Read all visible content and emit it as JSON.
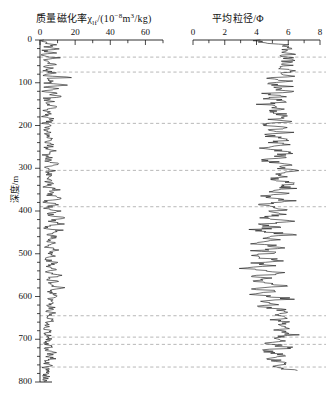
{
  "figure": {
    "y_axis": {
      "label": "深度/m",
      "ticks": [
        0,
        100,
        200,
        300,
        400,
        500,
        600,
        700,
        800
      ],
      "min": 0,
      "max": 800,
      "minor_step": 20
    },
    "dashed_markers": [
      40,
      75,
      195,
      305,
      390,
      645,
      695,
      712,
      765
    ],
    "line_color": "#1a1a1a",
    "dash_color": "#9a9a9a"
  },
  "panels": {
    "left": {
      "title_main": "质量磁化率",
      "title_symbol": "χ",
      "title_sub": "lf",
      "title_units_pre": "/(10",
      "title_units_sup": "−8",
      "title_units_post": "m",
      "title_units_sup2": "3",
      "title_units_end": "/kg)",
      "ticks": [
        0,
        20,
        40,
        60
      ],
      "min": 0,
      "max": 70
    },
    "right": {
      "title": "平均粒径/Φ",
      "ticks": [
        0,
        2,
        4,
        6,
        8
      ],
      "min": 0,
      "max": 8
    }
  },
  "chart_data": {
    "type": "line",
    "orientation": "vertical-depth",
    "ylabel": "深度/m",
    "ylim": [
      0,
      800
    ],
    "y_inverted": true,
    "grid": false,
    "legend": "none",
    "series": [
      {
        "name": "质量磁化率χlf/(10⁻⁸m³/kg)",
        "panel": "left",
        "xlabel": "质量磁化率χlf/(10⁻⁸m³/kg)",
        "xlim": [
          0,
          70
        ],
        "xticks": [
          0,
          20,
          40,
          60
        ],
        "depth": [
          0,
          5,
          9,
          12,
          15,
          18,
          21,
          24,
          27,
          30,
          33,
          36,
          39,
          42,
          45,
          48,
          51,
          54,
          57,
          60,
          63,
          66,
          69,
          72,
          75,
          78,
          81,
          84,
          87,
          90,
          93,
          96,
          99,
          102,
          105,
          108,
          111,
          114,
          117,
          120,
          124,
          128,
          132,
          136,
          140,
          144,
          148,
          152,
          156,
          160,
          165,
          170,
          175,
          180,
          185,
          190,
          195,
          200,
          205,
          210,
          215,
          220,
          225,
          230,
          235,
          240,
          245,
          250,
          255,
          260,
          265,
          270,
          275,
          280,
          285,
          290,
          295,
          300,
          305,
          310,
          315,
          320,
          325,
          330,
          335,
          340,
          345,
          350,
          355,
          360,
          365,
          370,
          375,
          380,
          385,
          390,
          395,
          400,
          405,
          410,
          415,
          420,
          425,
          430,
          435,
          440,
          445,
          450,
          455,
          460,
          465,
          470,
          475,
          480,
          485,
          490,
          495,
          500,
          505,
          510,
          515,
          520,
          525,
          530,
          535,
          540,
          545,
          550,
          555,
          560,
          565,
          570,
          575,
          580,
          585,
          590,
          595,
          600,
          605,
          610,
          615,
          620,
          625,
          630,
          635,
          640,
          645,
          650,
          655,
          660,
          665,
          670,
          675,
          680,
          685,
          690,
          695,
          700,
          705,
          710,
          715,
          720,
          725,
          730,
          735,
          740,
          745,
          750,
          755,
          760,
          765,
          770,
          775,
          780,
          785,
          790,
          795,
          800
        ],
        "values": [
          2,
          4,
          3,
          10,
          4,
          3,
          9,
          3,
          2,
          12,
          3,
          2,
          4,
          14,
          3,
          2,
          5,
          3,
          13,
          4,
          3,
          9,
          4,
          3,
          6,
          8,
          5,
          3,
          21,
          4,
          3,
          7,
          5,
          4,
          16,
          5,
          3,
          12,
          4,
          3,
          9,
          5,
          14,
          4,
          3,
          7,
          5,
          3,
          10,
          4,
          3,
          6,
          4,
          3,
          8,
          5,
          3,
          6,
          4,
          3,
          5,
          4,
          3,
          6,
          4,
          3,
          7,
          5,
          4,
          9,
          5,
          3,
          6,
          5,
          4,
          12,
          6,
          4,
          8,
          5,
          4,
          7,
          5,
          4,
          6,
          5,
          4,
          10,
          6,
          4,
          7,
          15,
          5,
          4,
          9,
          5,
          4,
          12,
          7,
          5,
          16,
          9,
          5,
          13,
          6,
          4,
          11,
          7,
          5,
          9,
          6,
          4,
          8,
          5,
          4,
          10,
          6,
          4,
          7,
          5,
          4,
          9,
          6,
          4,
          8,
          6,
          5,
          11,
          7,
          5,
          9,
          6,
          5,
          13,
          8,
          5,
          10,
          7,
          5,
          9,
          6,
          5,
          8,
          6,
          5,
          7,
          6,
          5,
          6,
          5,
          4,
          5,
          4,
          4,
          5,
          4,
          4,
          5,
          4,
          4,
          6,
          5,
          4,
          8,
          6,
          5,
          7,
          5,
          4,
          5,
          4,
          3,
          4,
          3,
          3,
          4,
          3,
          3,
          3,
          3,
          3
        ]
      },
      {
        "name": "平均粒径/Φ",
        "panel": "right",
        "xlabel": "平均粒径/Φ",
        "xlim": [
          0,
          8
        ],
        "xticks": [
          0,
          2,
          4,
          6,
          8
        ],
        "depth": [
          0,
          6,
          12,
          18,
          24,
          30,
          36,
          42,
          48,
          54,
          60,
          66,
          72,
          78,
          84,
          90,
          96,
          102,
          108,
          114,
          120,
          126,
          132,
          138,
          144,
          150,
          156,
          162,
          168,
          174,
          180,
          186,
          192,
          198,
          204,
          210,
          216,
          222,
          228,
          234,
          240,
          246,
          252,
          258,
          264,
          270,
          276,
          282,
          288,
          294,
          300,
          306,
          312,
          318,
          324,
          330,
          336,
          342,
          348,
          354,
          360,
          366,
          372,
          378,
          384,
          390,
          396,
          402,
          408,
          414,
          420,
          426,
          432,
          438,
          444,
          450,
          456,
          462,
          468,
          474,
          480,
          486,
          492,
          498,
          504,
          510,
          516,
          522,
          528,
          534,
          540,
          546,
          552,
          558,
          564,
          570,
          576,
          582,
          588,
          594,
          600,
          606,
          612,
          618,
          624,
          630,
          636,
          642,
          648,
          654,
          660,
          666,
          672,
          678,
          684,
          690,
          696,
          702,
          708,
          714,
          720,
          726,
          732,
          738,
          744,
          750,
          756,
          762,
          768,
          774,
          780
        ],
        "values": [
          3.9,
          4.8,
          5.6,
          5.7,
          5.8,
          5.9,
          6.0,
          5.8,
          6.1,
          5.9,
          6.2,
          5.4,
          6.3,
          5.6,
          6.1,
          5.0,
          5.8,
          4.6,
          5.9,
          5.2,
          6.2,
          4.3,
          5.6,
          4.9,
          6.0,
          4.4,
          5.3,
          5.8,
          4.8,
          5.6,
          6.1,
          5.2,
          5.9,
          4.6,
          5.7,
          5.1,
          6.0,
          4.4,
          5.5,
          5.9,
          5.0,
          5.8,
          4.6,
          5.4,
          6.0,
          5.2,
          5.7,
          4.3,
          5.6,
          6.1,
          5.8,
          6.2,
          5.4,
          6.0,
          4.9,
          5.7,
          6.3,
          5.5,
          6.1,
          5.0,
          5.9,
          4.4,
          5.6,
          6.2,
          4.1,
          5.3,
          6.0,
          4.7,
          5.8,
          4.3,
          5.5,
          6.1,
          4.0,
          5.4,
          3.8,
          5.0,
          6.0,
          4.2,
          5.2,
          3.6,
          4.8,
          5.9,
          4.0,
          5.1,
          3.4,
          4.6,
          5.7,
          3.9,
          4.9,
          3.2,
          4.4,
          5.8,
          3.7,
          5.0,
          3.5,
          4.7,
          5.9,
          4.1,
          5.3,
          3.8,
          5.1,
          6.0,
          4.5,
          5.5,
          4.2,
          5.6,
          6.1,
          4.8,
          5.8,
          5.2,
          6.0,
          5.5,
          6.2,
          5.0,
          5.9,
          6.3,
          5.4,
          6.0,
          4.6,
          5.2,
          6.1,
          4.3,
          5.0,
          5.8,
          4.7,
          5.4,
          6.0,
          5.1,
          5.6,
          6.2
        ]
      }
    ]
  }
}
